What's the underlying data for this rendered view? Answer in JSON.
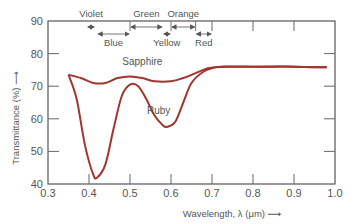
{
  "chart_data": {
    "type": "line",
    "title": "",
    "xlabel": "Wavelength, λ (μm) ⟶",
    "ylabel": "Transmittance (%) ⟶",
    "xlim": [
      0.3,
      1.0
    ],
    "ylim": [
      40,
      90
    ],
    "x_ticks": [
      "0.3",
      "0.4",
      "0.5",
      "0.6",
      "0.7",
      "0.8",
      "0.9",
      "1.0"
    ],
    "y_ticks": [
      "40",
      "50",
      "60",
      "70",
      "80",
      "90"
    ],
    "grid": false,
    "series": [
      {
        "name": "Sapphire",
        "color": "#a0362f",
        "x": [
          0.35,
          0.38,
          0.41,
          0.44,
          0.47,
          0.5,
          0.53,
          0.56,
          0.6,
          0.63,
          0.66,
          0.69,
          0.72,
          0.76,
          0.8,
          0.85,
          0.9,
          0.95,
          0.98
        ],
        "values": [
          73.5,
          72.5,
          71.0,
          71.0,
          72.5,
          73.0,
          72.5,
          71.5,
          71.5,
          72.5,
          74.0,
          75.5,
          76.0,
          76.0,
          76.0,
          76.0,
          76.0,
          75.8,
          75.8
        ]
      },
      {
        "name": "Ruby",
        "color": "#a0362f",
        "x": [
          0.35,
          0.37,
          0.39,
          0.41,
          0.42,
          0.44,
          0.46,
          0.48,
          0.5,
          0.52,
          0.54,
          0.56,
          0.58,
          0.59,
          0.61,
          0.63,
          0.65,
          0.68,
          0.71,
          0.75,
          0.8,
          0.9,
          0.98
        ],
        "values": [
          73.5,
          66.0,
          52.0,
          43.0,
          42.0,
          46.0,
          57.0,
          67.0,
          70.5,
          70.0,
          66.0,
          61.0,
          58.0,
          57.5,
          59.0,
          65.0,
          71.0,
          74.5,
          75.8,
          76.0,
          76.0,
          76.0,
          75.8
        ]
      }
    ],
    "annotations": {
      "curve_labels": [
        {
          "text": "Sapphire",
          "x": 0.53,
          "y": 76.5
        },
        {
          "text": "Ruby",
          "x": 0.57,
          "y": 61.5
        }
      ],
      "color_bands": [
        {
          "name": "Violet",
          "range": [
            0.395,
            0.415
          ],
          "row": "top"
        },
        {
          "name": "Blue",
          "range": [
            0.42,
            0.5
          ],
          "row": "bottom"
        },
        {
          "name": "Green",
          "range": [
            0.5,
            0.58
          ],
          "row": "top"
        },
        {
          "name": "Yellow",
          "range": [
            0.58,
            0.6
          ],
          "row": "bottom"
        },
        {
          "name": "Orange",
          "range": [
            0.6,
            0.66
          ],
          "row": "top"
        },
        {
          "name": "Red",
          "range": [
            0.66,
            0.7
          ],
          "row": "bottom"
        }
      ]
    }
  }
}
